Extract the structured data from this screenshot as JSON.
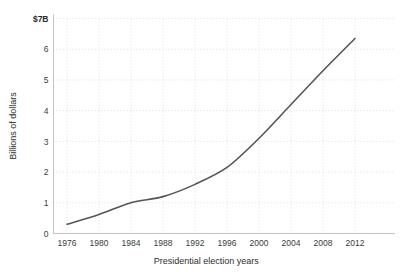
{
  "chart_data": {
    "type": "line",
    "title": "",
    "subtitle": "",
    "xlabel": "Presidential election years",
    "ylabel": "Billions of dollars",
    "categories": [
      1976,
      1980,
      1984,
      1988,
      1992,
      1996,
      2000,
      2004,
      2008,
      2012
    ],
    "x_tick_labels": [
      "1976",
      "1980",
      "1984",
      "1988",
      "1992",
      "1996",
      "2000",
      "2004",
      "2008",
      "2012"
    ],
    "y_tick_labels": [
      "0",
      "1",
      "2",
      "3",
      "4",
      "5",
      "6",
      "$7B"
    ],
    "y_tick_values": [
      0,
      1,
      2,
      3,
      4,
      5,
      6,
      7
    ],
    "values": [
      0.3,
      0.62,
      1.0,
      1.2,
      1.6,
      2.15,
      3.1,
      4.2,
      5.3,
      6.35
    ],
    "series": [
      {
        "name": "Total spending",
        "values": [
          0.3,
          0.62,
          1.0,
          1.2,
          1.6,
          2.15,
          3.1,
          4.2,
          5.3,
          6.35
        ]
      }
    ],
    "xlim": [
      1976,
      2012
    ],
    "ylim": [
      0,
      7
    ],
    "grid": true,
    "grid_style": "dotted",
    "legend": "none",
    "line_color": "#555555",
    "grid_color": "#cfcfcf",
    "spine_color": "#bdbdbd",
    "background_color": "#ffffff",
    "text_color": "#333333"
  }
}
